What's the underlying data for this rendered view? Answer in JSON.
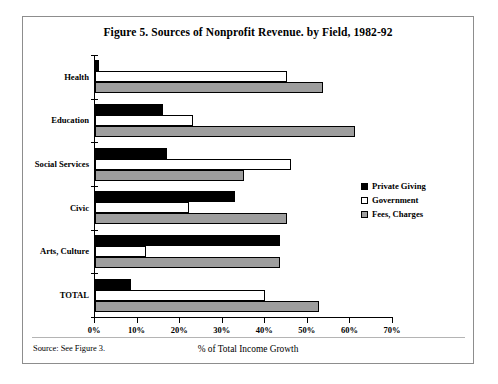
{
  "figure": {
    "title": "Figure 5. Sources of Nonprofit Revenue. by Field, 1982-92",
    "source_note": "Source: See Figure 3.",
    "xlabel": "% of Total Income Growth"
  },
  "legend": {
    "position": "right-middle",
    "items": [
      {
        "label": "Private Giving",
        "color": "#000000",
        "key": "series-private"
      },
      {
        "label": "Government",
        "color": "#ffffff",
        "key": "series-government"
      },
      {
        "label": "Fees, Charges",
        "color": "#9e9e9e",
        "key": "series-fees"
      }
    ]
  },
  "chart_data": {
    "type": "bar",
    "orientation": "horizontal",
    "title": "Figure 5. Sources of Nonprofit Revenue. by Field, 1982-92",
    "xlabel": "% of Total Income Growth",
    "ylabel": "",
    "xlim": [
      0,
      70
    ],
    "grid": false,
    "legend_position": "right-middle",
    "xticks": [
      0,
      10,
      20,
      30,
      40,
      50,
      60,
      70
    ],
    "xticklabels": [
      "0%",
      "10%",
      "20%",
      "30%",
      "40%",
      "50%",
      "60%",
      "70%"
    ],
    "categories": [
      "Health",
      "Education",
      "Social Services",
      "Civic",
      "Arts, Culture",
      "TOTAL"
    ],
    "series": [
      {
        "name": "Private Giving",
        "color": "#000000",
        "values": [
          1,
          16,
          17,
          33,
          43.5,
          8.5
        ]
      },
      {
        "name": "Government",
        "color": "#ffffff",
        "values": [
          45,
          23,
          46,
          22,
          12,
          40
        ]
      },
      {
        "name": "Fees, Charges",
        "color": "#9e9e9e",
        "values": [
          53.5,
          61,
          35,
          45,
          43.5,
          52.5
        ]
      }
    ]
  }
}
